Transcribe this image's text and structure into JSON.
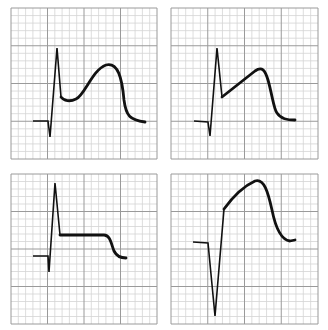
{
  "figure": {
    "colors": {
      "background": "#ffffff",
      "grid_minor": "#d4d4d4",
      "grid_major": "#9a9a9a",
      "trace": "#111111"
    },
    "grid": {
      "major_divisions": 4,
      "minor_per_major": 5
    },
    "panels": [
      {
        "id": "top-left",
        "label": "Panel 1: R wave with concave-up ST elevation and dome",
        "box": {
          "x": 11,
          "y": 8,
          "w": 146,
          "h": 151
        },
        "qrs_path": "M33,121 L48,121 L50,137 L57,48 L61,97",
        "st_path": "M61,97 C64,101 70,102 76,99 C85,95 92,70 106,65 C118,62 122,78 124,100 C126,116 130,120 145,122"
      },
      {
        "id": "top-right",
        "label": "Panel 2: R wave with straight upsloping ST segment",
        "box": {
          "x": 171,
          "y": 8,
          "w": 147,
          "h": 151
        },
        "qrs_path": "M194,121 L208,122 L210,136 L217,48 L222,97",
        "st_path": "M222,97 L255,71 C262,66 265,70 268,80 C272,94 274,110 277,113 C281,119 287,120 295,120"
      },
      {
        "id": "bottom-left",
        "label": "Panel 3: R wave with flat horizontal ST plateau",
        "box": {
          "x": 11,
          "y": 174,
          "w": 146,
          "h": 150
        },
        "qrs_path": "M33,256 L48,256 L49,272 L55,183 L60,235",
        "st_path": "M60,235 L104,235 C110,235 111,243 114,251 C117,257 121,258 126,258"
      },
      {
        "id": "bottom-right",
        "label": "Panel 4: Deep Q/S wave with tombstone ST elevation",
        "box": {
          "x": 171,
          "y": 174,
          "w": 147,
          "h": 150
        },
        "qrs_path": "M193,242 L208,243 L215,316 L224,209",
        "st_path": "M224,209 C232,198 244,186 255,181 C264,178 268,192 272,210 C276,230 282,240 290,241 L295,240"
      }
    ]
  }
}
